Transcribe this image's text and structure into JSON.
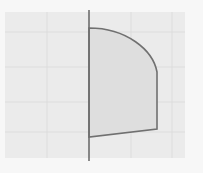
{
  "figure": {
    "type": "diagram",
    "colors": {
      "page_background": "#f7f7f7",
      "grid_background": "#ebebeb",
      "grid_line": "#d9d9d9",
      "axis": "#6e6e6e",
      "region_fill": "#dedede",
      "region_stroke": "#707070"
    },
    "grid": {
      "x": 5,
      "y": 12,
      "width": 180,
      "height": 146,
      "vertical_lines_x": [
        47,
        89,
        131,
        172
      ],
      "horizontal_lines_y": [
        32,
        67,
        102,
        132
      ]
    },
    "axis": {
      "x": 89,
      "y_start": 10,
      "y_end": 161
    },
    "region": {
      "top_left": [
        89,
        28
      ],
      "arc_end": [
        157,
        72
      ],
      "bottom_right": [
        157,
        129
      ],
      "bottom_left": [
        89,
        137
      ]
    }
  }
}
